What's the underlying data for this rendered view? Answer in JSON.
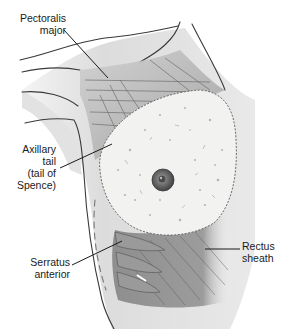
{
  "figure": {
    "colors": {
      "background": "#ffffff",
      "skin_light": "#e6e6e6",
      "skin_shadow": "#c9c9c9",
      "muscle": "#a9a9a9",
      "muscle_dark": "#8a8a8a",
      "gland": "#f2f2f0",
      "nipple": "#6a6a6a",
      "leader_line": "#1a1a1a",
      "text": "#1a1a1a"
    }
  },
  "labels": {
    "pectoralis": {
      "line1": "Pectoralis",
      "line2": "major"
    },
    "axillary": {
      "line1": "Axillary",
      "line2": "tail",
      "line3": "(tail of",
      "line4": "Spence)"
    },
    "serratus": {
      "line1": "Serratus",
      "line2": "anterior"
    },
    "rectus": {
      "line1": "Rectus",
      "line2": "sheath"
    }
  }
}
